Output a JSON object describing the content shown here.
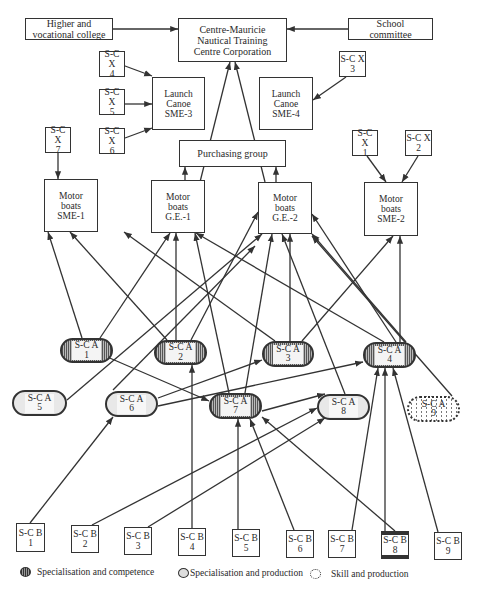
{
  "diagram": {
    "type": "organisational network diagram",
    "colors": {
      "line": "#333333",
      "background": "#ffffff"
    }
  },
  "nodes": {
    "college": {
      "label": [
        "Higher and",
        "vocational college"
      ],
      "x": 25,
      "y": 18,
      "w": 88,
      "h": 22
    },
    "centre": {
      "label": [
        "Centre-Mauricie",
        "Nautical Training",
        "Centre Corporation"
      ],
      "x": 178,
      "y": 18,
      "w": 109,
      "h": 44
    },
    "school": {
      "label": [
        "School",
        "committee"
      ],
      "x": 348,
      "y": 18,
      "w": 85,
      "h": 22
    },
    "sme3": {
      "label": [
        "Launch",
        "Canoe",
        "SME-3"
      ],
      "x": 152,
      "y": 77,
      "w": 53,
      "h": 53
    },
    "sme4": {
      "label": [
        "Launch",
        "Canoe",
        "SME-4"
      ],
      "x": 259,
      "y": 77,
      "w": 54,
      "h": 53
    },
    "purchasing": {
      "label": [
        "Purchasing group"
      ],
      "x": 179,
      "y": 140,
      "w": 107,
      "h": 27
    },
    "sme1": {
      "label": [
        "Motor",
        "boats",
        "SME-1"
      ],
      "x": 44,
      "y": 179,
      "w": 54,
      "h": 53
    },
    "ge1": {
      "label": [
        "Motor",
        "boats",
        "G.E.-1"
      ],
      "x": 151,
      "y": 180,
      "w": 54,
      "h": 53
    },
    "ge2": {
      "label": [
        "Motor",
        "boats",
        "G.E.-2"
      ],
      "x": 258,
      "y": 182,
      "w": 54,
      "h": 52
    },
    "sme2": {
      "label": [
        "Motor",
        "boats",
        "SME-2"
      ],
      "x": 364,
      "y": 182,
      "w": 54,
      "h": 54
    },
    "x1": {
      "label": [
        "S-C X",
        "1"
      ],
      "x": 352,
      "y": 130,
      "w": 26,
      "h": 26
    },
    "x2": {
      "label": [
        "S-C X",
        "2"
      ],
      "x": 405,
      "y": 130,
      "w": 27,
      "h": 26
    },
    "x3": {
      "label": [
        "S-C X",
        "3"
      ],
      "x": 339,
      "y": 51,
      "w": 27,
      "h": 26
    },
    "x4": {
      "label": [
        "S-C X",
        "4"
      ],
      "x": 99,
      "y": 51,
      "w": 26,
      "h": 26
    },
    "x5": {
      "label": [
        "S-C X",
        "5"
      ],
      "x": 99,
      "y": 89,
      "w": 26,
      "h": 26
    },
    "x6": {
      "label": [
        "S-C X",
        "6"
      ],
      "x": 99,
      "y": 128,
      "w": 26,
      "h": 26
    },
    "x7": {
      "label": [
        "S-C X",
        "7"
      ],
      "x": 45,
      "y": 127,
      "w": 26,
      "h": 26
    },
    "a1": {
      "label": [
        "S-C A",
        "1"
      ],
      "x": 60,
      "y": 338,
      "w": 53,
      "h": 25,
      "kind": "comp"
    },
    "a2": {
      "label": [
        "S-C A",
        "2"
      ],
      "x": 154,
      "y": 340,
      "w": 53,
      "h": 25,
      "kind": "comp"
    },
    "a3": {
      "label": [
        "S-C A",
        "3"
      ],
      "x": 262,
      "y": 341,
      "w": 52,
      "h": 26,
      "kind": "comp"
    },
    "a4": {
      "label": [
        "S-C A",
        "4"
      ],
      "x": 363,
      "y": 342,
      "w": 53,
      "h": 26,
      "kind": "comp"
    },
    "a5": {
      "label": [
        "S-C A",
        "5"
      ],
      "x": 12,
      "y": 390,
      "w": 55,
      "h": 26,
      "kind": "prod"
    },
    "a6": {
      "label": [
        "S-C A",
        "6"
      ],
      "x": 105,
      "y": 391,
      "w": 53,
      "h": 26,
      "kind": "prod"
    },
    "a7": {
      "label": [
        "S-C A",
        "7"
      ],
      "x": 209,
      "y": 393,
      "w": 53,
      "h": 26,
      "kind": "comp"
    },
    "a8": {
      "label": [
        "S-C A",
        "8"
      ],
      "x": 317,
      "y": 394,
      "w": 53,
      "h": 26,
      "kind": "prod"
    },
    "a9": {
      "label": [
        "S-C A",
        "9"
      ],
      "x": 407,
      "y": 396,
      "w": 53,
      "h": 26,
      "kind": "skill"
    },
    "b1": {
      "label": [
        "S-C B",
        "1"
      ],
      "x": 16,
      "y": 523,
      "w": 29,
      "h": 29
    },
    "b2": {
      "label": [
        "S-C B",
        "2"
      ],
      "x": 71,
      "y": 525,
      "w": 28,
      "h": 28
    },
    "b3": {
      "label": [
        "S-C B",
        "3"
      ],
      "x": 124,
      "y": 527,
      "w": 28,
      "h": 28
    },
    "b4": {
      "label": [
        "S-C B",
        "4"
      ],
      "x": 178,
      "y": 528,
      "w": 28,
      "h": 28
    },
    "b5": {
      "label": [
        "S-C B",
        "5"
      ],
      "x": 232,
      "y": 529,
      "w": 28,
      "h": 28
    },
    "b6": {
      "label": [
        "S-C B",
        "6"
      ],
      "x": 286,
      "y": 530,
      "w": 28,
      "h": 28
    },
    "b7": {
      "label": [
        "S-C B",
        "7"
      ],
      "x": 328,
      "y": 530,
      "w": 28,
      "h": 28
    },
    "b8": {
      "label": [
        "S-C B",
        "8"
      ],
      "x": 381,
      "y": 531,
      "w": 28,
      "h": 28
    },
    "b9": {
      "label": [
        "S-C B",
        "9"
      ],
      "x": 434,
      "y": 532,
      "w": 28,
      "h": 28
    }
  },
  "edges": [
    [
      113,
      29,
      178,
      29
    ],
    [
      348,
      29,
      287,
      29
    ],
    [
      200,
      182,
      230,
      62
    ],
    [
      265,
      182,
      235,
      62
    ],
    [
      185,
      180,
      185,
      167
    ],
    [
      276,
      182,
      276,
      167
    ],
    [
      117,
      63,
      152,
      76
    ],
    [
      125,
      104,
      152,
      104
    ],
    [
      125,
      138,
      152,
      128
    ],
    [
      346,
      77,
      313,
      100
    ],
    [
      58,
      153,
      58,
      179
    ],
    [
      367,
      156,
      386,
      182
    ],
    [
      418,
      156,
      402,
      182
    ],
    [
      82,
      338,
      48,
      232
    ],
    [
      100,
      338,
      170,
      233
    ],
    [
      167,
      340,
      70,
      232
    ],
    [
      176,
      340,
      176,
      233
    ],
    [
      191,
      340,
      258,
      212
    ],
    [
      275,
      341,
      124,
      232
    ],
    [
      290,
      341,
      290,
      234
    ],
    [
      302,
      341,
      393,
      236
    ],
    [
      384,
      342,
      196,
      233
    ],
    [
      396,
      342,
      312,
      214
    ],
    [
      406,
      342,
      312,
      234
    ],
    [
      400,
      342,
      400,
      236
    ],
    [
      67,
      400,
      262,
      234
    ],
    [
      113,
      390,
      255,
      246
    ],
    [
      229,
      393,
      195,
      233
    ],
    [
      245,
      393,
      272,
      234
    ],
    [
      345,
      394,
      282,
      234
    ],
    [
      452,
      396,
      312,
      236
    ],
    [
      105,
      356,
      209,
      401
    ],
    [
      158,
      398,
      262,
      360
    ],
    [
      158,
      406,
      363,
      362
    ],
    [
      262,
      411,
      325,
      394
    ],
    [
      30,
      523,
      113,
      417
    ],
    [
      92,
      525,
      317,
      408
    ],
    [
      148,
      527,
      325,
      418
    ],
    [
      192,
      528,
      192,
      365
    ],
    [
      238,
      529,
      238,
      419
    ],
    [
      294,
      530,
      250,
      419
    ],
    [
      395,
      531,
      262,
      417
    ],
    [
      352,
      530,
      378,
      368
    ],
    [
      385,
      531,
      385,
      368
    ],
    [
      438,
      532,
      393,
      368
    ]
  ],
  "legend": {
    "items": [
      {
        "kind": "comp",
        "label": "Specialisation and competence"
      },
      {
        "kind": "prod",
        "label": "Specialisation and production"
      },
      {
        "kind": "skill",
        "label": "Skill and production"
      }
    ]
  }
}
